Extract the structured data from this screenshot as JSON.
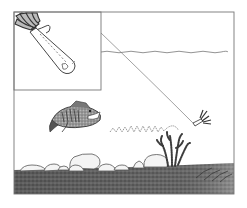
{
  "illustration": {
    "description": "Line-art fishing illustration: bass chasing a jig lure along a rocky bottom with a weed clump, with an inset close-up of the jig",
    "alt_text": "Bass fishing jig illustration",
    "elements": {
      "frame": "outer-frame",
      "inset": "jig-closeup-inset",
      "water_surface": "water-surface-line",
      "fishing_line": "fishing-line",
      "lure": "jig-lure",
      "retrieve_path": "zigzag-retrieve-path",
      "fish": "largemouth-bass",
      "plant": "weed-clump",
      "rocks": "bottom-rocks",
      "bottom": "lake-bottom"
    },
    "colors": {
      "ink": "#555555",
      "line": "#8a8a8a",
      "bottom_dark": "#4a4a4a",
      "bottom_mid": "#7a7a7a",
      "rock_fill": "#f2f2f2",
      "background": "#ffffff"
    }
  }
}
